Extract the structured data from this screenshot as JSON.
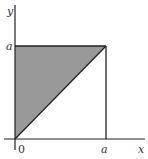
{
  "diagram": {
    "type": "region-plot",
    "axes": {
      "x_label": "x",
      "y_label": "y",
      "origin_label": "0"
    },
    "ticks": {
      "x_tick_label": "a",
      "y_tick_label": "a"
    },
    "square": {
      "description": "Square with corners (0,0), (a,0), (a,a), (0,a)"
    },
    "shaded_region": {
      "description": "Triangle above the diagonal y = x within the square: vertices (0,0), (0,a), (a,a)",
      "fill_color": "#999999"
    },
    "diagonal": {
      "description": "Line y = x from (0,0) to (a,a)"
    },
    "colors": {
      "lines": "#222222",
      "shading": "#999999",
      "background": "#ffffff"
    }
  }
}
